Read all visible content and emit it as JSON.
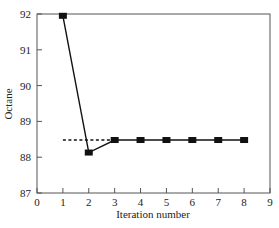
{
  "chart_data": {
    "type": "line",
    "title": "",
    "xlabel": "Iteration number",
    "ylabel": "Octane",
    "xlim": [
      0,
      9
    ],
    "ylim": [
      87,
      92
    ],
    "xticks": [
      0,
      1,
      2,
      3,
      4,
      5,
      6,
      7,
      8,
      9
    ],
    "yticks": [
      87,
      88,
      89,
      90,
      91,
      92
    ],
    "grid": false,
    "legend": null,
    "series": [
      {
        "name": "Octane",
        "style": "solid line with square markers",
        "x": [
          1,
          2,
          3,
          4,
          5,
          6,
          7,
          8
        ],
        "y": [
          91.95,
          88.13,
          88.48,
          88.48,
          88.48,
          88.48,
          88.48,
          88.48
        ]
      },
      {
        "name": "reference",
        "style": "dashed line",
        "x": [
          1,
          3
        ],
        "y": [
          88.48,
          88.48
        ]
      }
    ]
  },
  "colors": {
    "line": "#111111",
    "axis": "#555555",
    "background": "#ffffff"
  }
}
